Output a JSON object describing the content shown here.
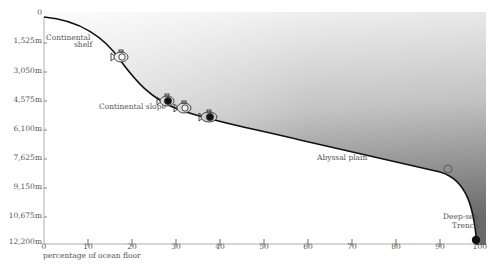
{
  "diagram": {
    "title": "",
    "y_axis": {
      "labels": [
        "0",
        "1,525m",
        "3,050m",
        "4,575m",
        "6,100m",
        "7,625m",
        "9,150m",
        "10,675m",
        "12,200m"
      ]
    },
    "x_axis": {
      "title": "percentage of ocean floor",
      "labels": [
        "0",
        "10",
        "20",
        "30",
        "40",
        "50",
        "60",
        "70",
        "80",
        "90",
        "100"
      ]
    },
    "zones": {
      "shelf_line1": "Continental",
      "shelf_line2": "shelf",
      "slope": "Continental slope",
      "abyssal": "Abyssal plain",
      "trench_line1": "Deep-sea",
      "trench_line2": "Trench"
    },
    "icons": [
      {
        "name": "submersible-icon",
        "filled": false
      },
      {
        "name": "submersible-icon",
        "filled": true
      },
      {
        "name": "submersible-icon",
        "filled": false
      },
      {
        "name": "submersible-icon",
        "filled": true
      },
      {
        "name": "bathyscaphe-float-icon",
        "filled": false
      },
      {
        "name": "trench-marker-icon",
        "filled": true
      }
    ],
    "colors": {
      "curve": "#111111",
      "gradient_top": "#f6f6f6",
      "gradient_bottom": "#6f6f6f",
      "text": "#555555"
    }
  }
}
